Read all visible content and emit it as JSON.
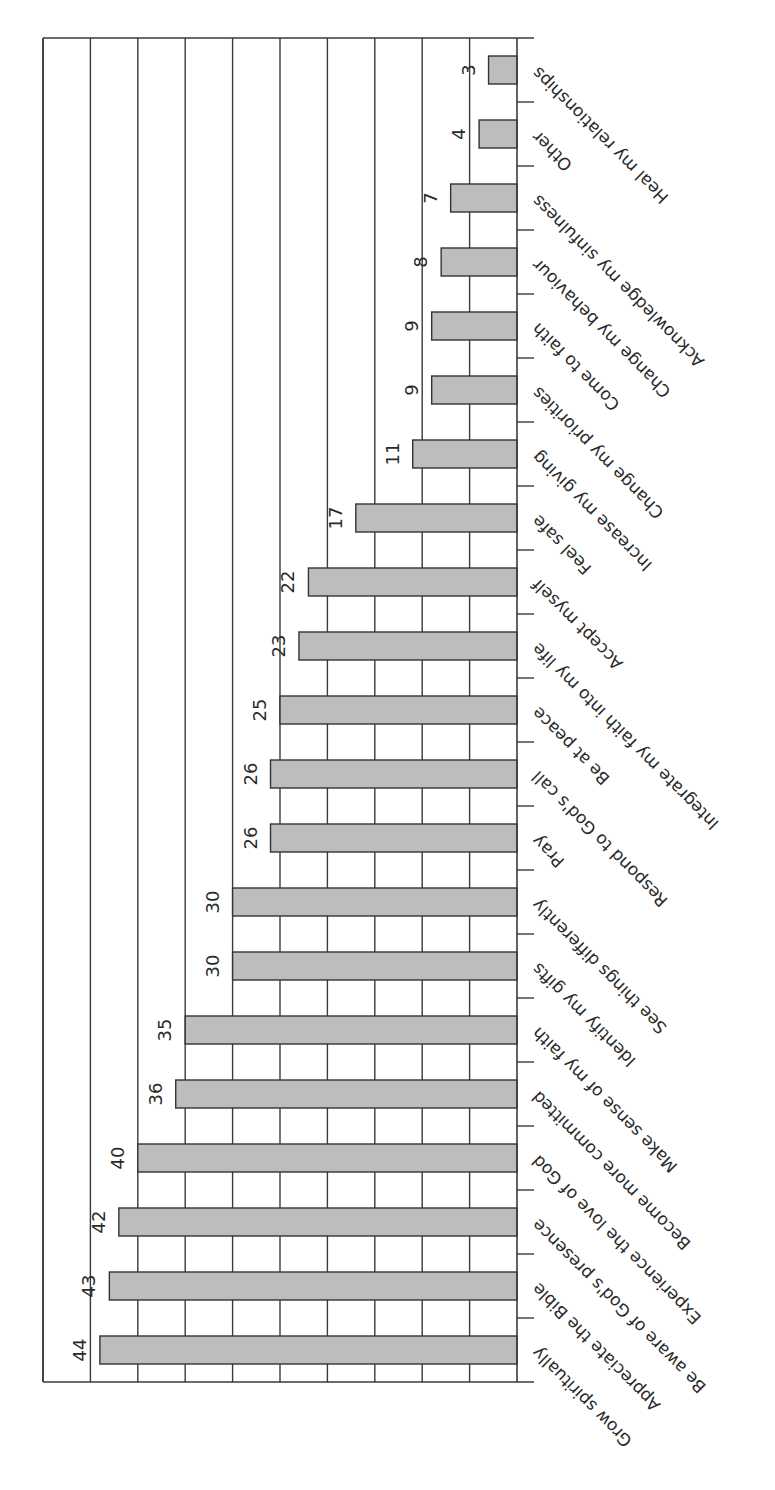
{
  "chart_data": {
    "type": "bar",
    "orientation": "vertical chart, page rotated 90° counter-clockwise",
    "title": "",
    "xlabel": "",
    "ylabel": "",
    "ylim": [
      0,
      50
    ],
    "grid": true,
    "grid_step": 5,
    "legend": null,
    "categories": [
      "Grow spiritually",
      "Appreciate the Bible",
      "Be aware of God's presence",
      "Experience the love of God",
      "Become more committed",
      "Make sense of my faith",
      "Identify my gifts",
      "See things differently",
      "Pray",
      "Respond to God's call",
      "Be at peace",
      "Integrate my faith into my life",
      "Accept myself",
      "Feel safe",
      "Increase my giving",
      "Change my priorities",
      "Come to faith",
      "Change my behaviour",
      "Acknowledge my sinfulness",
      "Other",
      "Heal my relationships"
    ],
    "values": [
      44,
      43,
      42,
      40,
      36,
      35,
      30,
      30,
      26,
      26,
      25,
      23,
      22,
      17,
      11,
      9,
      9,
      8,
      7,
      4,
      3
    ],
    "value_labels": [
      "44",
      "43",
      "42",
      "40",
      "36",
      "35",
      "30",
      "30",
      "26",
      "26",
      "25",
      "23",
      "22",
      "17",
      "11",
      "9",
      "9",
      "8",
      "7",
      "4",
      "3"
    ]
  },
  "colors": {
    "bar_fill": "#bdbdbd",
    "bar_stroke": "#333333",
    "grid": "#3a3a3a",
    "text": "#2a2a2a"
  }
}
